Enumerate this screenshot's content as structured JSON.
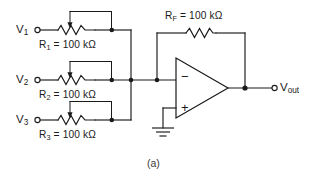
{
  "figure": {
    "caption": "(a)",
    "title_role": "inverting-summing-amplifier-schematic"
  },
  "inputs": [
    {
      "id": "v1",
      "source_label": "V",
      "source_sub": "1",
      "resistor_name": "R",
      "resistor_sub": "1",
      "resistor_value": "= 100 kΩ",
      "resistor_full_label": "R₁ = 100 kΩ",
      "resistor_type": "variable-resistor"
    },
    {
      "id": "v2",
      "source_label": "V",
      "source_sub": "2",
      "resistor_name": "R",
      "resistor_sub": "2",
      "resistor_value": "= 100 kΩ",
      "resistor_full_label": "R₂ = 100 kΩ",
      "resistor_type": "variable-resistor"
    },
    {
      "id": "v3",
      "source_label": "V",
      "source_sub": "3",
      "resistor_name": "R",
      "resistor_sub": "3",
      "resistor_value": "= 100 kΩ",
      "resistor_full_label": "R₃ = 100 kΩ",
      "resistor_type": "variable-resistor"
    }
  ],
  "feedback": {
    "resistor_name": "R",
    "resistor_sub": "F",
    "resistor_value": "= 100 kΩ",
    "resistor_full_label": "R_F = 100 kΩ",
    "resistor_type": "fixed-resistor"
  },
  "opamp": {
    "inverting_sign": "−",
    "noninverting_sign": "+",
    "noninverting_connection": "ground"
  },
  "output": {
    "label": "V",
    "label_sub": "out"
  },
  "colors": {
    "line": "#1a1a1a",
    "background": "#ffffff",
    "caption": "#3a3a3a"
  }
}
